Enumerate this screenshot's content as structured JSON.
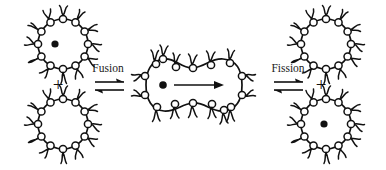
{
  "figure": {
    "type": "vesicle-fusion-fission-schematic",
    "background_color": "#ffffff",
    "ink_color": "#111111",
    "width": 386,
    "height": 170
  },
  "labels": {
    "fusion": "Fusion",
    "fission": "Fission",
    "plus_left": "+",
    "plus_right": "+"
  },
  "reaction": {
    "left_equilibrium_symbol": "⇌",
    "right_equilibrium_symbol": "⇌",
    "transfer_arrow_symbol": "→"
  },
  "vesicles": [
    {
      "id": "top-left-vesicle",
      "position": "top-left",
      "center": [
        63,
        44
      ],
      "radius": 25,
      "has_cargo": true,
      "cargo_color": "#111111",
      "cargo_offset": [
        -8,
        0
      ],
      "head_count": 12,
      "shape": "circle"
    },
    {
      "id": "bottom-left-vesicle",
      "position": "bottom-left",
      "center": [
        63,
        124
      ],
      "radius": 25,
      "has_cargo": false,
      "cargo_color": "#111111",
      "cargo_offset": [
        0,
        0
      ],
      "head_count": 12,
      "shape": "circle"
    },
    {
      "id": "fused-vesicle",
      "position": "center",
      "center": [
        193,
        85
      ],
      "radius": 0,
      "has_cargo": true,
      "cargo_color": "#111111",
      "cargo_offset": [
        -30,
        0
      ],
      "head_count": 16,
      "shape": "peanut"
    },
    {
      "id": "top-right-vesicle",
      "position": "top-right",
      "center": [
        326,
        44
      ],
      "radius": 25,
      "has_cargo": false,
      "cargo_color": "#111111",
      "cargo_offset": [
        0,
        0
      ],
      "head_count": 12,
      "shape": "circle"
    },
    {
      "id": "bottom-right-vesicle",
      "position": "bottom-right",
      "center": [
        326,
        124
      ],
      "radius": 25,
      "has_cargo": true,
      "cargo_color": "#111111",
      "cargo_offset": [
        -2,
        0
      ],
      "head_count": 12,
      "shape": "circle"
    }
  ],
  "annotations": {
    "cargo_description": "encapsulated cargo particle",
    "transfer_description": "cargo transfer direction inside fused vesicle"
  }
}
